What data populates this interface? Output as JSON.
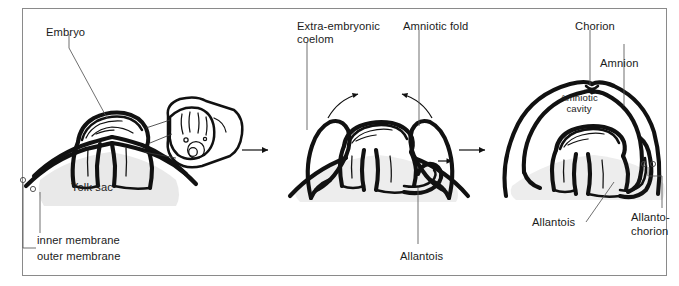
{
  "figure": {
    "panel_count": 3,
    "background_color": "#ffffff",
    "frame_color": "#8a8a8a",
    "ink_color": "#111111",
    "yolk_fill_color": "#e9e9e9"
  },
  "panels": [
    {
      "id": "panel-early",
      "stage_order": 1,
      "labels": [
        {
          "key": "embryo",
          "text": "Embryo"
        },
        {
          "key": "yolk_sac",
          "text": "Yolk sac"
        },
        {
          "key": "inner_membrane",
          "text": "inner membrane"
        },
        {
          "key": "outer_membrane",
          "text": "outer membrane"
        }
      ]
    },
    {
      "id": "panel-folding",
      "stage_order": 2,
      "labels": [
        {
          "key": "extra_embryonic_coelom_line1",
          "text": "Extra-embryonic"
        },
        {
          "key": "extra_embryonic_coelom_line2",
          "text": "coelom"
        },
        {
          "key": "amniotic_fold",
          "text": "Amniotic fold"
        },
        {
          "key": "allantois",
          "text": "Allantois"
        }
      ]
    },
    {
      "id": "panel-complete",
      "stage_order": 3,
      "labels": [
        {
          "key": "chorion",
          "text": "Chorion"
        },
        {
          "key": "amnion",
          "text": "Amnion"
        },
        {
          "key": "amniotic_cavity_line1",
          "text": "Amniotic"
        },
        {
          "key": "amniotic_cavity_line2",
          "text": "cavity"
        },
        {
          "key": "allantois",
          "text": "Allantois"
        },
        {
          "key": "allantochorion_line1",
          "text": "Allanto-"
        },
        {
          "key": "allantochorion_line2",
          "text": "chorion"
        }
      ]
    }
  ],
  "transitions": [
    {
      "key": "arrow_1_to_2",
      "icon": "right-arrow-icon"
    },
    {
      "key": "arrow_2_to_3",
      "icon": "right-arrow-icon"
    }
  ],
  "motion_arrows": [
    {
      "key": "fold_left",
      "icon": "curved-arrow-icon",
      "meaning": "left amniotic fold grows toward midline"
    },
    {
      "key": "fold_right",
      "icon": "curved-arrow-icon",
      "meaning": "right amniotic fold grows toward midline"
    },
    {
      "key": "allantois_growth",
      "icon": "short-arrow-icon",
      "meaning": "allantois expands outward"
    }
  ]
}
